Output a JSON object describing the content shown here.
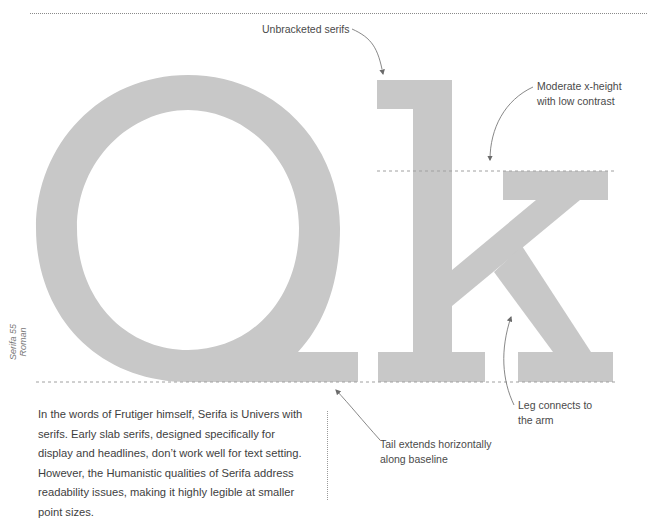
{
  "specimen": {
    "glyphs": "Qk",
    "typeface_label": "Serifa 55 Roman",
    "glyph_color": "#c8c8c8",
    "guide_color": "#a0a0a0",
    "arrow_color": "#6a6a6a"
  },
  "annotations": {
    "unbracketed_serifs": "Unbracketed serifs",
    "x_height_line1": "Moderate x-height",
    "x_height_line2": "with low contrast",
    "leg_line1": "Leg connects to",
    "leg_line2": "the arm",
    "tail_line1": "Tail extends horizontally",
    "tail_line2": "along baseline"
  },
  "body": {
    "paragraph": "In the words of Frutiger himself, Serifa is Univers with serifs. Early slab serifs, designed specifically for display and headlines, don’t work well for text setting. However, the Humanistic qualities of Serifa address readability issues, making it highly legible at smaller point sizes."
  }
}
